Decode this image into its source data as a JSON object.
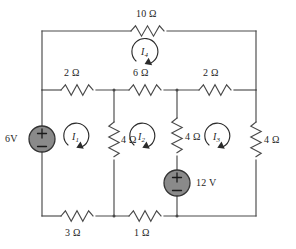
{
  "diagram": {
    "type": "electrical-circuit-schematic",
    "unit_symbol": "Ω",
    "colors": {
      "wire": "#4a4a4a",
      "source_fill": "#808080",
      "source_stroke": "#333333",
      "text": "#262626",
      "background": "#ffffff"
    }
  },
  "resistors": [
    {
      "id": "r-top-10",
      "label": "10 Ω",
      "value": 10,
      "unit": "Ω",
      "orientation": "horizontal",
      "branch": "top-rail"
    },
    {
      "id": "r-mid-left-2",
      "label": "2 Ω",
      "value": 2,
      "unit": "Ω",
      "orientation": "horizontal",
      "branch": "middle-rail-left"
    },
    {
      "id": "r-mid-center-6",
      "label": "6 Ω",
      "value": 6,
      "unit": "Ω",
      "orientation": "horizontal",
      "branch": "middle-rail-center"
    },
    {
      "id": "r-mid-right-2",
      "label": "2 Ω",
      "value": 2,
      "unit": "Ω",
      "orientation": "horizontal",
      "branch": "middle-rail-right"
    },
    {
      "id": "r-vert-left-4",
      "label": "4 Ω",
      "value": 4,
      "unit": "Ω",
      "orientation": "vertical",
      "branch": "vertical-node-2"
    },
    {
      "id": "r-vert-center-4",
      "label": "4 Ω",
      "value": 4,
      "unit": "Ω",
      "orientation": "vertical",
      "branch": "vertical-node-3"
    },
    {
      "id": "r-vert-right-4",
      "label": "4 Ω",
      "value": 4,
      "unit": "Ω",
      "orientation": "vertical",
      "branch": "right-rail"
    },
    {
      "id": "r-bot-left-3",
      "label": "3 Ω",
      "value": 3,
      "unit": "Ω",
      "orientation": "horizontal",
      "branch": "bottom-rail-left"
    },
    {
      "id": "r-bot-center-1",
      "label": "1 Ω",
      "value": 1,
      "unit": "Ω",
      "orientation": "horizontal",
      "branch": "bottom-rail-center"
    }
  ],
  "sources": [
    {
      "id": "vs-6v",
      "label": "6V",
      "value": 6,
      "unit": "V",
      "polarity_top": "+",
      "polarity_bottom": "−",
      "orientation": "vertical",
      "branch": "left-rail",
      "label_side": "left"
    },
    {
      "id": "vs-12v",
      "label": "12 V",
      "value": 12,
      "unit": "V",
      "polarity_top": "+",
      "polarity_bottom": "−",
      "orientation": "vertical",
      "branch": "vertical-node-3",
      "label_side": "right"
    }
  ],
  "mesh_currents": [
    {
      "id": "i4",
      "base": "I",
      "subscript": "4",
      "label": "I4",
      "direction": "clockwise",
      "loop": "top"
    },
    {
      "id": "i1",
      "base": "I",
      "subscript": "1",
      "label": "I1",
      "direction": "clockwise",
      "loop": "lower-left"
    },
    {
      "id": "i2",
      "base": "I",
      "subscript": "2",
      "label": "I2",
      "direction": "clockwise",
      "loop": "lower-center"
    },
    {
      "id": "i3",
      "base": "I",
      "subscript": "3",
      "label": "I3",
      "direction": "clockwise",
      "loop": "lower-right"
    }
  ]
}
